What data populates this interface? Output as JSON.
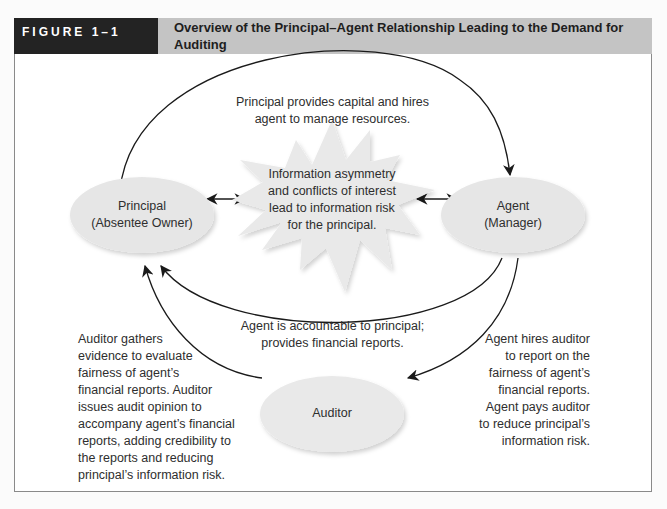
{
  "figure": {
    "number": "FIGURE 1–1",
    "title": "Overview of the Principal–Agent Relationship Leading to the Demand for Auditing"
  },
  "nodes": {
    "principal": {
      "line1": "Principal",
      "line2": "(Absentee Owner)"
    },
    "agent": {
      "line1": "Agent",
      "line2": "(Manager)"
    },
    "auditor": {
      "label": "Auditor"
    },
    "risk_burst": {
      "lines": [
        "Information asymmetry",
        "and conflicts of interest",
        "lead to information risk",
        "for the principal."
      ]
    }
  },
  "edges": {
    "principal_to_agent": {
      "lines": [
        "Principal provides capital and hires",
        "agent to manage resources."
      ]
    },
    "agent_to_principal": {
      "lines": [
        "Agent is accountable to principal;",
        "provides financial reports."
      ]
    },
    "agent_to_auditor": {
      "lines": [
        "Agent hires auditor",
        "to report on the",
        "fairness of agent’s",
        "financial reports.",
        "Agent pays auditor",
        "to reduce principal’s",
        "information risk."
      ]
    },
    "auditor_to_principal": {
      "lines": [
        "Auditor gathers",
        "evidence to evaluate",
        "fairness of agent’s",
        "financial reports. Auditor",
        "issues audit opinion to",
        "accompany agent’s financial",
        "reports, adding credibility to",
        "the reports and reducing",
        "principal’s information risk."
      ]
    }
  },
  "colors": {
    "header_dark": "#232323",
    "header_gray": "#c4c4c4",
    "ellipse_fill": "#e6e6e6",
    "burst_fill": "#e9e9e9",
    "line": "#1a1a1a"
  }
}
